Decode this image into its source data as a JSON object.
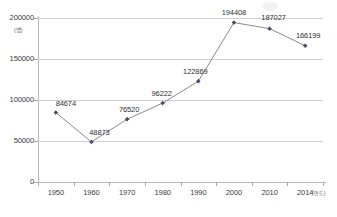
{
  "chart_data": {
    "type": "line",
    "title": "",
    "xlabel": "(연도)",
    "ylabel": "(명)",
    "categories": [
      "1950",
      "1960",
      "1970",
      "1980",
      "1990",
      "2000",
      "2010",
      "2014"
    ],
    "values": [
      84674,
      48873,
      76520,
      96222,
      122869,
      194408,
      187027,
      166199
    ],
    "data_labels": [
      "84674",
      "48873",
      "76520",
      "96222",
      "122869",
      "194408",
      "187027",
      "166199"
    ],
    "ylim": [
      0,
      200000
    ],
    "y_ticks": [
      0,
      50000,
      100000,
      150000,
      200000
    ],
    "y_tick_labels": [
      "0",
      "50000",
      "100000",
      "150000",
      "200000"
    ],
    "grid": true,
    "legend": "none",
    "series_color": "#4a4a6a",
    "marker": "diamond",
    "line_color": "#7a7a8c"
  },
  "axes": {
    "y_unit_label": "(명)",
    "x_unit_label": "(연도)"
  }
}
